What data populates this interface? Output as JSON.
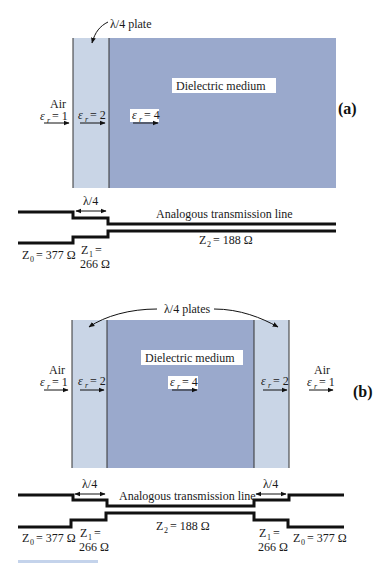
{
  "colors": {
    "plate": "#c9d5e6",
    "medium": "#9aa9cc",
    "line": "#111111",
    "caption": "#9db6dd"
  },
  "panel_a": {
    "label": "(a)",
    "plate_annotation": "λ/4 plate",
    "medium_label": "Dielectric medium",
    "air_label": "Air",
    "air_eps": "= 1",
    "plate_eps": "= 2",
    "medium_eps": "= 4",
    "eps_symbol": "ε",
    "eps_sub": "r",
    "tline": {
      "quarter_wave": "λ/4",
      "title": "Analogous transmission line",
      "z0_sym": "Z",
      "z0_sub": "0",
      "z0_val": "= 377 Ω",
      "z1_sym": "Z",
      "z1_sub": "1",
      "z1_eq": "=",
      "z1_val": "266 Ω",
      "z2_sym": "Z",
      "z2_sub": "2",
      "z2_val": "= 188 Ω"
    }
  },
  "panel_b": {
    "label": "(b)",
    "plate_annotation": "λ/4 plates",
    "medium_label": "Dielectric medium",
    "air_left_label": "Air",
    "air_left_eps": "= 1",
    "plate_left_eps": "= 2",
    "medium_eps": "= 4",
    "plate_right_eps": "= 2",
    "air_right_label": "Air",
    "air_right_eps": "= 1",
    "eps_symbol": "ε",
    "eps_sub": "r",
    "tline": {
      "quarter_wave_left": "λ/4",
      "quarter_wave_right": "λ/4",
      "title": "Analogous transmission line",
      "z0_left_sym": "Z",
      "z0_left_sub": "0",
      "z0_left_val": "= 377 Ω",
      "z1_left_sym": "Z",
      "z1_left_sub": "1",
      "z1_left_eq": "=",
      "z1_left_val": "266 Ω",
      "z2_sym": "Z",
      "z2_sub": "2",
      "z2_val": "= 188 Ω",
      "z1_right_sym": "Z",
      "z1_right_sub": "1",
      "z1_right_eq": "=",
      "z1_right_val": "266 Ω",
      "z0_right_sym": "Z",
      "z0_right_sub": "0",
      "z0_right_val": "= 377 Ω"
    }
  }
}
